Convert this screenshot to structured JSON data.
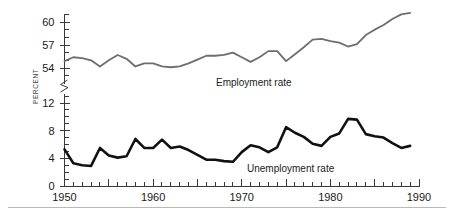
{
  "chart_data": {
    "type": "line",
    "title": "",
    "subtitle": "",
    "xlabel": "",
    "ylabel": "PERCENT",
    "xlim": [
      1950,
      1990
    ],
    "ylim_upper": [
      53,
      62
    ],
    "ylim_lower": [
      0,
      13
    ],
    "grid": false,
    "legend_position": "inline-annotation",
    "axis_break": true,
    "axis_break_note": "y-axis broken between 54 and 12",
    "x_major_ticks": [
      1950,
      1955,
      1960,
      1965,
      1970,
      1975,
      1980,
      1985,
      1990
    ],
    "x_tick_labels": [
      "1950",
      "",
      "1960",
      "",
      "1970",
      "",
      "1980",
      "",
      "1990"
    ],
    "x_minor_tick_step": 1,
    "y_upper_ticks": [
      54,
      57,
      60
    ],
    "y_upper_tick_labels": [
      "54",
      "57",
      "60"
    ],
    "y_lower_ticks": [
      0,
      4,
      8,
      12
    ],
    "y_lower_tick_labels": [
      "0",
      "4",
      "8",
      "12"
    ],
    "series": [
      {
        "name": "Employment rate",
        "label": "Employment rate",
        "color": "#6e6e6e",
        "stroke_width": 1.8,
        "panel": "upper",
        "x": [
          1950,
          1951,
          1952,
          1953,
          1954,
          1955,
          1956,
          1957,
          1958,
          1959,
          1960,
          1961,
          1962,
          1963,
          1964,
          1965,
          1966,
          1967,
          1968,
          1969,
          1970,
          1971,
          1972,
          1973,
          1974,
          1975,
          1976,
          1977,
          1978,
          1979,
          1980,
          1981,
          1982,
          1983,
          1984,
          1985,
          1986,
          1987,
          1988,
          1989
        ],
        "values": [
          54.9,
          55.4,
          55.3,
          55.0,
          54.2,
          55.0,
          55.7,
          55.2,
          54.2,
          54.6,
          54.6,
          54.2,
          54.1,
          54.2,
          54.6,
          55.1,
          55.6,
          55.6,
          55.7,
          56.0,
          55.4,
          54.8,
          55.4,
          56.2,
          56.2,
          54.9,
          55.8,
          56.7,
          57.7,
          57.8,
          57.5,
          57.3,
          56.8,
          57.1,
          58.3,
          59.0,
          59.6,
          60.4,
          61.0,
          61.2
        ]
      },
      {
        "name": "Unemployment rate",
        "label": "Unemployment rate",
        "color": "#111111",
        "stroke_width": 2.6,
        "panel": "lower",
        "x": [
          1950,
          1951,
          1952,
          1953,
          1954,
          1955,
          1956,
          1957,
          1958,
          1959,
          1960,
          1961,
          1962,
          1963,
          1964,
          1965,
          1966,
          1967,
          1968,
          1969,
          1970,
          1971,
          1972,
          1973,
          1974,
          1975,
          1976,
          1977,
          1978,
          1979,
          1980,
          1981,
          1982,
          1983,
          1984,
          1985,
          1986,
          1987,
          1988,
          1989
        ],
        "values": [
          5.3,
          3.3,
          3.0,
          2.9,
          5.5,
          4.4,
          4.1,
          4.3,
          6.8,
          5.5,
          5.5,
          6.7,
          5.5,
          5.7,
          5.2,
          4.5,
          3.8,
          3.8,
          3.6,
          3.5,
          4.9,
          5.9,
          5.6,
          4.9,
          5.6,
          8.5,
          7.7,
          7.1,
          6.1,
          5.8,
          7.1,
          7.6,
          9.7,
          9.6,
          7.5,
          7.2,
          7.0,
          6.2,
          5.5,
          5.8
        ]
      }
    ],
    "annotations": [
      {
        "text": "Employment rate",
        "x_px": 216,
        "y_px": 86
      },
      {
        "text": "Unemployment rate",
        "x_px": 247,
        "y_px": 172
      }
    ]
  },
  "chart_meta": {
    "axis_label_vertical": "PERCENT"
  }
}
